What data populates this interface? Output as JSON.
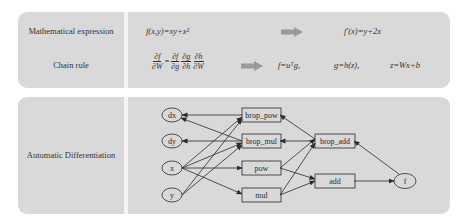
{
  "rows": {
    "math_expression": {
      "label": "Mathematical expression",
      "input": "f(x,y)=xy+x²",
      "output": "f′(x)=y+2x"
    },
    "chain_rule": {
      "label": "Chain rule",
      "lhs_num": "∂f",
      "lhs_den": "∂W",
      "equals": "=",
      "terms": [
        {
          "num": "∂f",
          "den": "∂g"
        },
        {
          "num": "∂g",
          "den": "∂h"
        },
        {
          "num": "∂h",
          "den": "∂W"
        }
      ],
      "definitions": [
        "f=uᵀg,",
        "g=h(z),",
        "z=Wx+b"
      ]
    },
    "autodiff": {
      "label": "Automatic Differentiation",
      "nodes": {
        "dx": "dx",
        "dy": "dy",
        "x": "x",
        "y": "y",
        "brop_pow": "brop_pow",
        "brop_mul": "brop_mul",
        "pow": "pow",
        "mul": "mul",
        "brop_add": "brop_add",
        "add": "add",
        "f": "f"
      }
    }
  },
  "colors": {
    "panel": "#d9d9d9",
    "divider": "#f4f4f4",
    "arrow": "#9a9a9a",
    "stroke": "#2a2a2a"
  }
}
